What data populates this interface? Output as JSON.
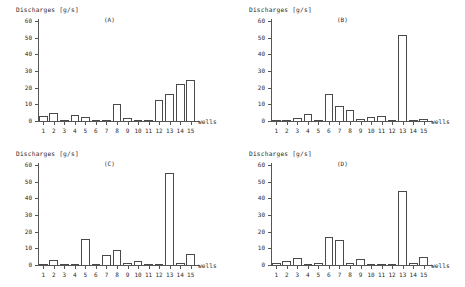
{
  "figure": {
    "axis_color": "#555555",
    "bar_edge_color": "#4a4a4a",
    "background": "#ffffff"
  },
  "chart_data": [
    {
      "type": "bar",
      "title": "(A)",
      "ylabel": "Discharges [g/s]",
      "xlabel": "wells",
      "categories": [
        "1",
        "2",
        "3",
        "4",
        "5",
        "6",
        "7",
        "8",
        "9",
        "10",
        "11",
        "12",
        "13",
        "14",
        "15"
      ],
      "values": [
        3,
        5,
        0.5,
        3.5,
        2.5,
        0.3,
        0.2,
        10,
        2,
        0.8,
        0.5,
        12.5,
        16,
        22,
        24.5
      ],
      "ylim": [
        0,
        60
      ],
      "yticks": [
        0,
        10,
        20,
        30,
        40,
        50,
        60
      ],
      "grid": false,
      "legend": false
    },
    {
      "type": "bar",
      "title": "(B)",
      "ylabel": "Discharges [g/s]",
      "xlabel": "wells",
      "categories": [
        "1",
        "2",
        "3",
        "4",
        "5",
        "6",
        "7",
        "8",
        "9",
        "10",
        "11",
        "12",
        "13",
        "14",
        "15"
      ],
      "values": [
        0.4,
        0.6,
        1.8,
        4.5,
        0.3,
        16.5,
        9,
        6.5,
        1.2,
        2.5,
        3.2,
        0.6,
        51.5,
        0.2,
        1.3
      ],
      "ylim": [
        0,
        60
      ],
      "yticks": [
        0,
        10,
        20,
        30,
        40,
        50,
        60
      ],
      "grid": false,
      "legend": false
    },
    {
      "type": "bar",
      "title": "(C)",
      "ylabel": "Discharges [g/s]",
      "xlabel": "wells",
      "categories": [
        "1",
        "2",
        "3",
        "4",
        "5",
        "6",
        "7",
        "8",
        "9",
        "10",
        "11",
        "12",
        "13",
        "14",
        "15"
      ],
      "values": [
        0.4,
        3,
        0.8,
        0.2,
        15.5,
        0.5,
        6,
        9,
        1.5,
        2.5,
        0.7,
        0.3,
        55,
        1,
        6.8
      ],
      "ylim": [
        0,
        60
      ],
      "yticks": [
        0,
        10,
        20,
        30,
        40,
        50,
        60
      ],
      "grid": false,
      "legend": false
    },
    {
      "type": "bar",
      "title": "(D)",
      "ylabel": "Discharges [g/s]",
      "xlabel": "wells",
      "categories": [
        "1",
        "2",
        "3",
        "4",
        "5",
        "6",
        "7",
        "8",
        "9",
        "10",
        "11",
        "12",
        "13",
        "14",
        "15"
      ],
      "values": [
        1,
        2.5,
        4.2,
        0.6,
        1.5,
        17,
        15,
        1.5,
        3.5,
        0.5,
        0.6,
        0.4,
        44.5,
        1,
        5
      ],
      "ylim": [
        0,
        60
      ],
      "yticks": [
        0,
        10,
        20,
        30,
        40,
        50,
        60
      ],
      "grid": false,
      "legend": false
    }
  ]
}
